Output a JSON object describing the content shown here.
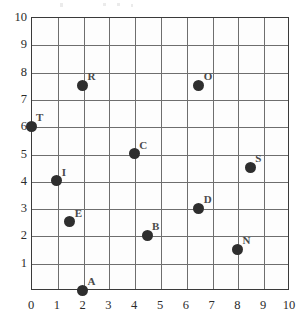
{
  "chart_data": {
    "type": "scatter",
    "title": "",
    "xlabel": "",
    "ylabel": "",
    "xlim": [
      0,
      10
    ],
    "ylim": [
      0,
      10
    ],
    "grid": true,
    "legend": "none",
    "x_ticks": [
      "0",
      "1",
      "2",
      "3",
      "4",
      "5",
      "6",
      "7",
      "8",
      "9",
      "10"
    ],
    "y_ticks": [
      "1",
      "2",
      "3",
      "4",
      "5",
      "6",
      "7",
      "8",
      "9",
      "10"
    ],
    "points": [
      {
        "label": "T",
        "x": 0,
        "y": 6
      },
      {
        "label": "R",
        "x": 2,
        "y": 7.5
      },
      {
        "label": "O",
        "x": 6.5,
        "y": 7.5
      },
      {
        "label": "C",
        "x": 4,
        "y": 5
      },
      {
        "label": "S",
        "x": 8.5,
        "y": 4.5
      },
      {
        "label": "I",
        "x": 1,
        "y": 4
      },
      {
        "label": "D",
        "x": 6.5,
        "y": 3
      },
      {
        "label": "E",
        "x": 1.5,
        "y": 2.5
      },
      {
        "label": "B",
        "x": 4.5,
        "y": 2
      },
      {
        "label": "N",
        "x": 8,
        "y": 1.5
      },
      {
        "label": "A",
        "x": 2,
        "y": 0
      }
    ]
  },
  "colors": {
    "point": "#2e2e2e",
    "grid": "#6e6e6e",
    "axis": "#3a3a3a",
    "tick_text": "#2b2b2b",
    "point_label": "#4a4a4a"
  }
}
